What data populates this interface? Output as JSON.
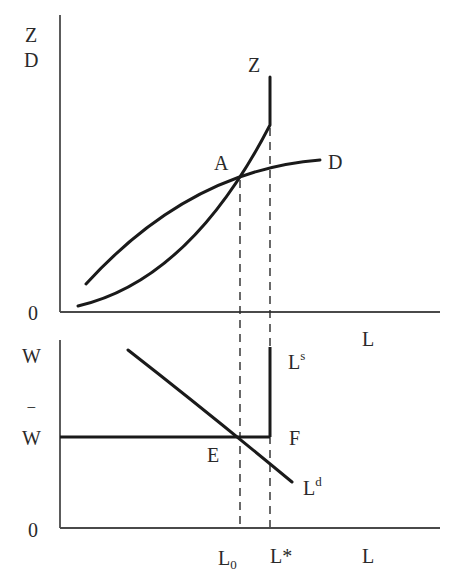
{
  "top_panel": {
    "y_axis_label_z": "Z",
    "y_axis_label_d": "D",
    "origin_label": "0",
    "x_axis_label": "L",
    "curve_z_label": "Z",
    "curve_d_label": "D",
    "intersection_label": "A"
  },
  "bottom_panel": {
    "y_axis_label": "W",
    "wage_floor_label": "W",
    "wage_floor_bar": "‾",
    "origin_label": "0",
    "x_axis_label": "L",
    "supply_label": "L",
    "supply_sup": "s",
    "demand_label": "L",
    "demand_sup": "d",
    "point_e_label": "E",
    "point_f_label": "F",
    "tick_l0_label": "L",
    "tick_l0_sub": "0",
    "tick_lstar_label": "L*"
  },
  "colors": {
    "curve": "#1a1a1a",
    "axis": "#4a4a4a",
    "background": "#ffffff"
  }
}
